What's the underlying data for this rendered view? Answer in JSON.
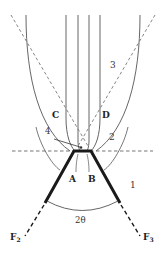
{
  "diagram": {
    "type": "geometric-optics-schematic",
    "colors": {
      "line": "#555555",
      "thick_line": "#1a1a1a",
      "dashed": "#777777",
      "text": "#333333",
      "background": "#ffffff"
    },
    "labels": {
      "region_1": "1",
      "region_2": "2",
      "region_3": "3",
      "region_4": "4",
      "point_a": "A",
      "point_b": "B",
      "point_c": "C",
      "point_d": "D",
      "angle": "2θ",
      "focus_2": "F",
      "focus_2_sub": "2",
      "focus_3": "F",
      "focus_3_sub": "3"
    }
  }
}
